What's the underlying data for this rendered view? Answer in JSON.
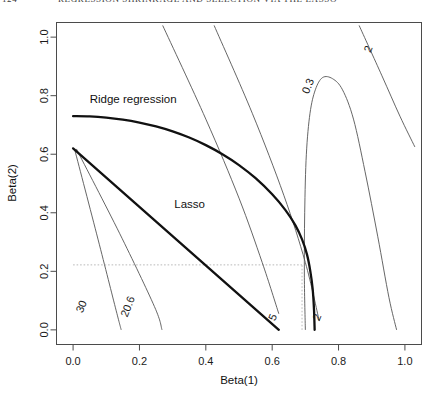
{
  "page": {
    "folio": "124",
    "running_head": "REGRESSION SHRINKAGE AND SELECTION VIA THE LASSO"
  },
  "chart_data": {
    "type": "line",
    "title": "",
    "xlabel": "Beta(1)",
    "ylabel": "Beta(2)",
    "xlim": [
      -0.05,
      1.05
    ],
    "ylim": [
      -0.05,
      1.05
    ],
    "xticks": [
      "0.0",
      "0.2",
      "0.4",
      "0.6",
      "0.8",
      "1.0"
    ],
    "xtick_values": [
      0.0,
      0.2,
      0.4,
      0.6,
      0.8,
      1.0
    ],
    "yticks": [
      "0.0",
      "0.2",
      "0.4",
      "0.6",
      "0.8",
      "1.0"
    ],
    "ytick_values": [
      0.0,
      0.2,
      0.4,
      0.6,
      0.8,
      1.0
    ],
    "grid": false,
    "legend": "none",
    "annotations": [
      {
        "text": "Ridge regression",
        "x": 0.05,
        "y": 0.775
      },
      {
        "text": "Lasso",
        "x": 0.305,
        "y": 0.415
      }
    ],
    "series": [
      {
        "name": "Ridge regression constraint boundary",
        "kind": "constraint-curve",
        "style": "thick-solid",
        "points": [
          [
            0.0,
            0.73
          ],
          [
            0.05,
            0.729
          ],
          [
            0.1,
            0.725
          ],
          [
            0.15,
            0.718
          ],
          [
            0.2,
            0.708
          ],
          [
            0.25,
            0.695
          ],
          [
            0.3,
            0.678
          ],
          [
            0.35,
            0.657
          ],
          [
            0.4,
            0.631
          ],
          [
            0.45,
            0.6
          ],
          [
            0.5,
            0.563
          ],
          [
            0.55,
            0.518
          ],
          [
            0.6,
            0.463
          ],
          [
            0.64,
            0.409
          ],
          [
            0.67,
            0.357
          ],
          [
            0.69,
            0.309
          ],
          [
            0.705,
            0.257
          ],
          [
            0.715,
            0.2
          ],
          [
            0.722,
            0.14
          ],
          [
            0.726,
            0.07
          ],
          [
            0.728,
            0.0
          ]
        ]
      },
      {
        "name": "Lasso constraint boundary",
        "kind": "constraint-curve",
        "style": "thick-solid",
        "points": [
          [
            0.0,
            0.62
          ],
          [
            0.62,
            0.0
          ]
        ]
      },
      {
        "name": "contour-30",
        "kind": "rss-contour",
        "label": "30",
        "label_pos": {
          "x": 0.035,
          "y": 0.075
        },
        "points": [
          [
            0.005,
            0.615
          ],
          [
            0.075,
            0.31
          ],
          [
            0.13,
            0.065
          ],
          [
            0.145,
            0.0
          ]
        ]
      },
      {
        "name": "contour-20.6",
        "kind": "rss-contour",
        "label": "20.6",
        "label_pos": {
          "x": 0.175,
          "y": 0.075
        },
        "points": [
          [
            0.01,
            0.618
          ],
          [
            0.14,
            0.33
          ],
          [
            0.245,
            0.08
          ],
          [
            0.268,
            0.0
          ]
        ]
      },
      {
        "name": "contour-5",
        "kind": "rss-contour",
        "label": "5",
        "label_pos": {
          "x": 0.612,
          "y": 0.038
        },
        "points": [
          [
            0.27,
            1.04
          ],
          [
            0.4,
            0.72
          ],
          [
            0.5,
            0.45
          ],
          [
            0.57,
            0.23
          ],
          [
            0.62,
            0.055
          ]
        ]
      },
      {
        "name": "contour-2",
        "kind": "rss-contour",
        "label": "2",
        "label_pos": {
          "x": 0.745,
          "y": 0.038
        },
        "points": [
          [
            0.425,
            1.04
          ],
          [
            0.54,
            0.74
          ],
          [
            0.635,
            0.46
          ],
          [
            0.7,
            0.23
          ],
          [
            0.742,
            0.03
          ]
        ]
      },
      {
        "name": "contour-0.3",
        "kind": "rss-contour",
        "label": "0.3",
        "label_pos": {
          "x": 0.718,
          "y": 0.828
        },
        "points": [
          [
            0.7,
            0.0
          ],
          [
            0.697,
            0.18
          ],
          [
            0.698,
            0.4
          ],
          [
            0.703,
            0.6
          ],
          [
            0.714,
            0.74
          ],
          [
            0.73,
            0.82
          ],
          [
            0.752,
            0.862
          ],
          [
            0.782,
            0.858
          ],
          [
            0.812,
            0.82
          ],
          [
            0.845,
            0.72
          ],
          [
            0.88,
            0.54
          ],
          [
            0.918,
            0.32
          ],
          [
            0.952,
            0.11
          ],
          [
            0.975,
            0.0
          ]
        ]
      },
      {
        "name": "contour-2-outer",
        "kind": "rss-contour",
        "label": "2",
        "label_pos": {
          "x": 0.9,
          "y": 0.955
        },
        "points": [
          [
            0.862,
            1.04
          ],
          [
            0.93,
            0.87
          ],
          [
            0.985,
            0.73
          ],
          [
            1.03,
            0.625
          ]
        ]
      }
    ],
    "guide_lines": [
      {
        "orientation": "vertical",
        "value": 0.69,
        "from": 0.0,
        "to": 0.222,
        "style": "dotted"
      },
      {
        "orientation": "horizontal",
        "value": 0.222,
        "from": 0.0,
        "to": 0.69,
        "style": "dotted"
      }
    ],
    "colors": {
      "axis": "#4b4b4b",
      "contour": "#555555",
      "main_curve": "#111111",
      "guide": "#b9b9b9",
      "background": "#ffffff"
    }
  }
}
